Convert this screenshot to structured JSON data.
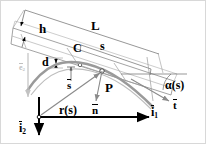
{
  "figure": {
    "type": "beam-kinematics-diagram",
    "colors": {
      "beam_outline": "#8c8c8c",
      "reference_curve": "#9a9a9a",
      "axis": "#000000",
      "vector_gray": "#8a8a8a",
      "frame": "#d8d8d8"
    }
  },
  "labels": {
    "thickness": "h",
    "length": "L",
    "centroid": "C",
    "arc_length": "s",
    "offset": "d",
    "point": "P",
    "arc_vector": "s",
    "normal_vector": "n",
    "tangent_vector": "t",
    "position_vector": "r(s)",
    "position_arg": "(s)",
    "angle": "α(s)",
    "basis_1": "i",
    "basis_1_sub": "1",
    "basis_2": "i",
    "basis_2_sub": "2",
    "ghost_basis": "e",
    "ghost_basis_sub": "2"
  }
}
